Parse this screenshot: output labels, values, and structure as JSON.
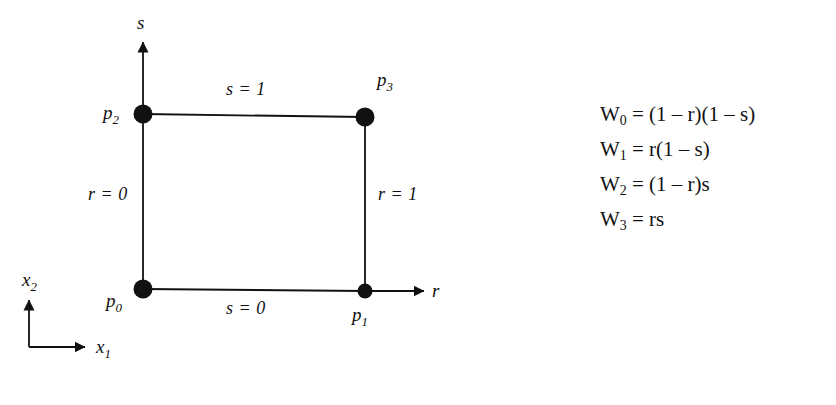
{
  "diagram": {
    "title_semantic": "bilinear-quadrilateral-shape-function-diagram",
    "nodes": [
      {
        "id": "p0",
        "label": "p",
        "sub": "0",
        "r": 0,
        "s": 0
      },
      {
        "id": "p1",
        "label": "p",
        "sub": "1",
        "r": 1,
        "s": 0
      },
      {
        "id": "p2",
        "label": "p",
        "sub": "2",
        "r": 0,
        "s": 1
      },
      {
        "id": "p3",
        "label": "p",
        "sub": "3",
        "r": 1,
        "s": 1
      }
    ],
    "edge_labels": {
      "top": "s = 1",
      "bottom": "s = 0",
      "left": "r = 0",
      "right": "r = 1"
    },
    "local_axes": {
      "horizontal": "r",
      "vertical": "s"
    },
    "global_axes": {
      "horizontal": "x",
      "horizontal_sub": "1",
      "vertical": "x",
      "vertical_sub": "2"
    }
  },
  "equations": [
    {
      "name": "W",
      "sub": "0",
      "rhs": "= (1 – r)(1 – s)"
    },
    {
      "name": "W",
      "sub": "1",
      "rhs": "= r(1 – s)"
    },
    {
      "name": "W",
      "sub": "2",
      "rhs": "= (1 – r)s"
    },
    {
      "name": "W",
      "sub": "3",
      "rhs": "= rs"
    }
  ],
  "colors": {
    "ink": "#111111",
    "background": "#ffffff"
  }
}
